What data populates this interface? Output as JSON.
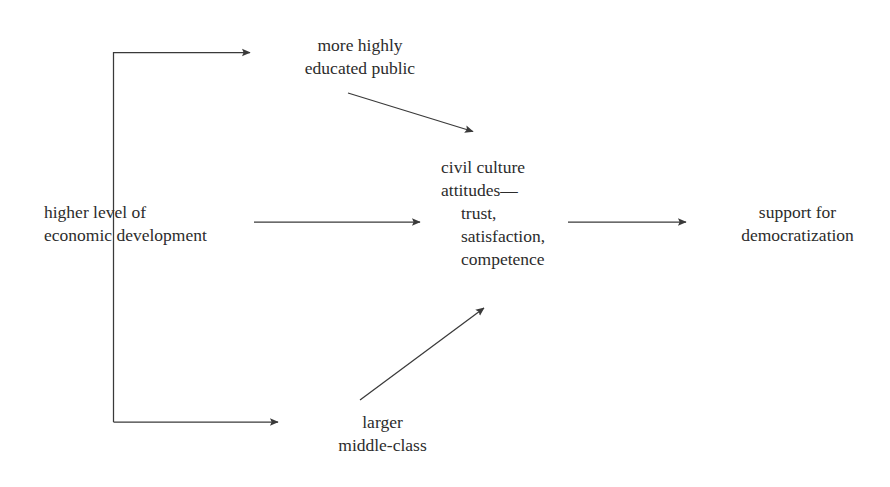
{
  "diagram": {
    "background_color": "#ffffff",
    "stroke_color": "#3a3a3a",
    "text_color": "#2c2c2c",
    "nodes": {
      "economic_development": {
        "lines": [
          "higher level of",
          "economic development"
        ]
      },
      "educated_public": {
        "lines": [
          "more highly",
          "educated public"
        ]
      },
      "civil_culture": {
        "lines": [
          "civil culture",
          "attitudes—",
          "trust,",
          "satisfaction,",
          "competence"
        ]
      },
      "middle_class": {
        "lines": [
          "larger",
          "middle-class"
        ]
      },
      "support_democratization": {
        "lines": [
          "support for",
          "democratization"
        ]
      }
    },
    "edges": [
      {
        "name": "economic-development-to-educated-public",
        "from": "economic_development",
        "to": "educated_public",
        "style": "elbow-up"
      },
      {
        "name": "economic-development-to-civil-culture",
        "from": "economic_development",
        "to": "civil_culture",
        "style": "straight-horizontal"
      },
      {
        "name": "economic-development-to-middle-class",
        "from": "economic_development",
        "to": "middle_class",
        "style": "elbow-down"
      },
      {
        "name": "educated-public-to-civil-culture",
        "from": "educated_public",
        "to": "civil_culture",
        "style": "diagonal-down"
      },
      {
        "name": "middle-class-to-civil-culture",
        "from": "middle_class",
        "to": "civil_culture",
        "style": "diagonal-up"
      },
      {
        "name": "civil-culture-to-support-democratization",
        "from": "civil_culture",
        "to": "support_democratization",
        "style": "straight-horizontal"
      }
    ]
  }
}
